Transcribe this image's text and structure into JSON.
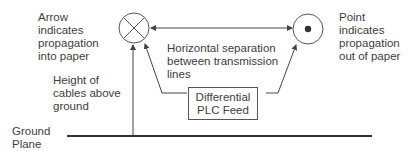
{
  "labels": {
    "arrow_into_paper": "Arrow\nindicates\npropagation\ninto paper",
    "point_out_of_paper": "Point\nindicates\npropagation\nout of paper",
    "horizontal_separation": "Horizontal separation\nbetween transmission\nlines",
    "height_of_cables": "Height of\ncables above\nground",
    "ground_plane": "Ground\nPlane",
    "feed_box": "Differential\nPLC Feed"
  },
  "symbols": {
    "left_conductor": "cross-circle-icon",
    "right_conductor": "dot-circle-icon"
  },
  "colors": {
    "line": "#444444",
    "ground_line": "#333333",
    "text": "#3d3d3d"
  }
}
